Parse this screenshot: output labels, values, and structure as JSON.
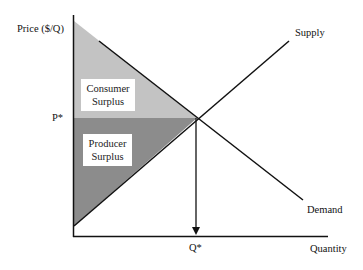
{
  "diagram": {
    "axes": {
      "y_label": "Price ($/Q)",
      "x_label": "Quantity"
    },
    "equilibrium": {
      "price_label": "P*",
      "quantity_label": "Q*"
    },
    "curves": {
      "supply_label": "Supply",
      "demand_label": "Demand"
    },
    "regions": {
      "consumer_surplus_line1": "Consumer",
      "consumer_surplus_line2": "Surplus",
      "producer_surplus_line1": "Producer",
      "producer_surplus_line2": "Surplus"
    },
    "colors": {
      "consumer_surplus": "#c3c3c3",
      "producer_surplus": "#8c8c8c",
      "lines": "#111111"
    }
  }
}
